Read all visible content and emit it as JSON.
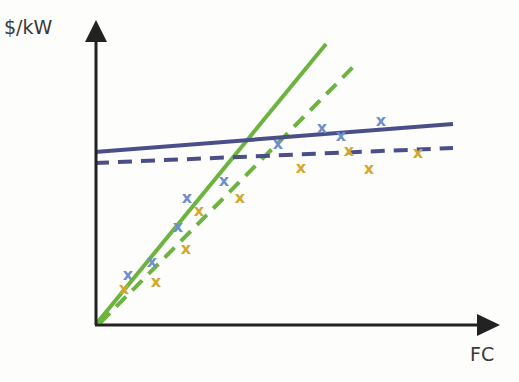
{
  "chart_data": {
    "type": "scatter",
    "title": "",
    "xlabel": "FC",
    "ylabel": "$/kW",
    "grid": false,
    "legend": null,
    "colors": {
      "axis": "#222222",
      "green": "#6cb33f",
      "navy": "#4a4f8a",
      "blue_marker": "#6f8fc8",
      "gold_marker": "#d4a72c"
    },
    "lines": [
      {
        "name": "green-solid",
        "style": "solid",
        "color": "#6cb33f",
        "points": [
          [
            97,
            323
          ],
          [
            326,
            44
          ]
        ]
      },
      {
        "name": "green-dashed",
        "style": "dashed",
        "color": "#6cb33f",
        "points": [
          [
            100,
            323
          ],
          [
            358,
            62
          ]
        ]
      },
      {
        "name": "navy-solid",
        "style": "solid",
        "color": "#4a4f8a",
        "points": [
          [
            95,
            152
          ],
          [
            453,
            124
          ]
        ]
      },
      {
        "name": "navy-dashed",
        "style": "dashed",
        "color": "#4a4f8a",
        "points": [
          [
            95,
            163
          ],
          [
            453,
            148
          ]
        ]
      }
    ],
    "series": [
      {
        "name": "blue-x",
        "marker": "x",
        "color": "#6f8fc8",
        "points": [
          [
            128,
            274
          ],
          [
            152,
            261
          ],
          [
            178,
            226
          ],
          [
            187,
            197
          ],
          [
            224,
            180
          ],
          [
            278,
            143
          ],
          [
            322,
            127
          ],
          [
            341,
            135
          ],
          [
            381,
            120
          ]
        ]
      },
      {
        "name": "gold-x",
        "marker": "x",
        "color": "#d4a72c",
        "points": [
          [
            124,
            288
          ],
          [
            156,
            281
          ],
          [
            186,
            248
          ],
          [
            199,
            210
          ],
          [
            240,
            197
          ],
          [
            301,
            167
          ],
          [
            349,
            150
          ],
          [
            369,
            168
          ],
          [
            418,
            152
          ]
        ]
      }
    ]
  }
}
